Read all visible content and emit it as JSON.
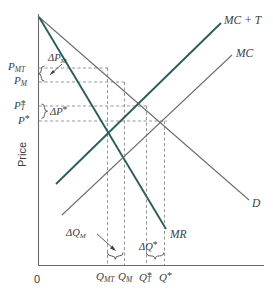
{
  "figure": {
    "axes": {
      "y_title": "Price",
      "origin_label": "0"
    },
    "y_ticks": [
      {
        "id": "p_mt",
        "base": "P",
        "sub": "MT",
        "star": "",
        "y": 68
      },
      {
        "id": "p_m",
        "base": "P",
        "sub": "M",
        "star": "",
        "y": 82
      },
      {
        "id": "p_t_star",
        "base": "P",
        "sub": "T",
        "star": "*",
        "y": 106
      },
      {
        "id": "p_star",
        "base": "P",
        "sub": "",
        "star": "*",
        "y": 121
      }
    ],
    "x_ticks": [
      {
        "id": "q_mt",
        "base": "Q",
        "sub": "MT",
        "star": "",
        "x": 107
      },
      {
        "id": "q_m",
        "base": "Q",
        "sub": "M",
        "star": "",
        "x": 124
      },
      {
        "id": "q_t_star",
        "base": "Q",
        "sub": "T",
        "star": "*",
        "x": 146
      },
      {
        "id": "q_star",
        "base": "Q",
        "sub": "",
        "star": "*",
        "x": 164
      }
    ],
    "curves": [
      {
        "id": "mc_plus_t",
        "label": "MC + T",
        "color": "#2f5c5c",
        "width": 1.9
      },
      {
        "id": "mc",
        "label": "MC",
        "color": "#6b6b6b",
        "width": 1.0
      },
      {
        "id": "demand",
        "label": "D",
        "color": "#6b6b6b",
        "width": 1.0
      },
      {
        "id": "mr",
        "label": "MR",
        "color": "#2f5c5c",
        "width": 1.9
      }
    ],
    "annotations": [
      {
        "id": "delta_p_m",
        "base": "ΔP",
        "sub": "M",
        "star": ""
      },
      {
        "id": "delta_p_star",
        "base": "ΔP",
        "sub": "",
        "star": "*"
      },
      {
        "id": "delta_q_m",
        "base": "ΔQ",
        "sub": "M",
        "star": ""
      },
      {
        "id": "delta_q_star",
        "base": "ΔQ",
        "sub": "",
        "star": "*"
      }
    ],
    "colors": {
      "teal": "#2f5c5c",
      "gray": "#6b6b6b",
      "dash": "#8a8a8a",
      "text": "#3d3d3d",
      "background": "#ffffff"
    }
  }
}
